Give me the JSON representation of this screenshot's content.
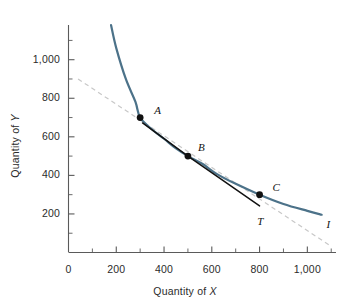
{
  "chart_data": {
    "type": "line",
    "title": "",
    "xlabel": "Quantity of X",
    "ylabel": "Quantity of Y",
    "xlim": [
      0,
      1120
    ],
    "ylim": [
      0,
      1180
    ],
    "grid": false,
    "legend": "none",
    "x_ticks_labeled": [
      {
        "value": 0,
        "label": "0"
      },
      {
        "value": 200,
        "label": "200"
      },
      {
        "value": 400,
        "label": "400"
      },
      {
        "value": 600,
        "label": "600"
      },
      {
        "value": 800,
        "label": "800"
      },
      {
        "value": 1000,
        "label": "1,000"
      }
    ],
    "y_ticks_labeled": [
      {
        "value": 200,
        "label": "200"
      },
      {
        "value": 400,
        "label": "400"
      },
      {
        "value": 600,
        "label": "600"
      },
      {
        "value": 800,
        "label": "800"
      },
      {
        "value": 1000,
        "label": "1,000"
      }
    ],
    "x_minor_tick_step": 100,
    "y_minor_tick_step": 100,
    "series": [
      {
        "name": "I",
        "role": "indifference-curve",
        "style": "solid",
        "color": "#4c7289",
        "label": "I",
        "label_x": 1080,
        "label_y": 180,
        "points": [
          {
            "x": 178,
            "y": 1180
          },
          {
            "x": 200,
            "y": 1060
          },
          {
            "x": 240,
            "y": 900
          },
          {
            "x": 280,
            "y": 782
          },
          {
            "x": 300,
            "y": 700
          },
          {
            "x": 350,
            "y": 638
          },
          {
            "x": 400,
            "y": 590
          },
          {
            "x": 450,
            "y": 540
          },
          {
            "x": 500,
            "y": 500
          },
          {
            "x": 560,
            "y": 460
          },
          {
            "x": 620,
            "y": 408
          },
          {
            "x": 700,
            "y": 356
          },
          {
            "x": 800,
            "y": 300
          },
          {
            "x": 900,
            "y": 252
          },
          {
            "x": 1000,
            "y": 216
          },
          {
            "x": 1060,
            "y": 196
          }
        ]
      },
      {
        "name": "T",
        "role": "tangent-line",
        "style": "solid",
        "color": "#111111",
        "label": "T",
        "label_x": 790,
        "label_y": 195,
        "points": [
          {
            "x": 310,
            "y": 672
          },
          {
            "x": 500,
            "y": 500
          },
          {
            "x": 800,
            "y": 242
          }
        ]
      },
      {
        "name": "budget-line",
        "role": "dashed-reference-line",
        "style": "dashed",
        "color": "#c8c8c8",
        "label": "",
        "points": [
          {
            "x": 40,
            "y": 900
          },
          {
            "x": 1090,
            "y": 40
          }
        ]
      }
    ],
    "annotated_points": [
      {
        "label": "A",
        "x": 300,
        "y": 700,
        "label_dx": 14,
        "label_dy": -14
      },
      {
        "label": "B",
        "x": 500,
        "y": 500,
        "label_dx": 10,
        "label_dy": -15
      },
      {
        "label": "C",
        "x": 800,
        "y": 300,
        "label_dx": 13,
        "label_dy": -14
      }
    ]
  },
  "axes": {
    "x_title": "Quantity of ",
    "x_title_var": "X",
    "y_title": "Quantity of ",
    "y_title_var": "Y"
  },
  "colors": {
    "curve": "#4c7289",
    "tangent": "#111111",
    "dashed": "#c8c8c8",
    "axis": "#5a5a5a",
    "text": "#2b2b2b",
    "background": "#ffffff"
  }
}
